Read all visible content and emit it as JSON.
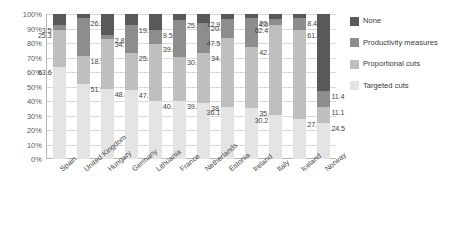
{
  "chart_data": {
    "type": "bar",
    "title": "",
    "xlabel": "",
    "ylabel": "",
    "stacked": true,
    "orientation": "vertical",
    "ylim": [
      0,
      100
    ],
    "ytick_labels": [
      "100%",
      "90%",
      "80%",
      "70%",
      "60%",
      "50%",
      "40%",
      "30%",
      "20%",
      "10%",
      "0%"
    ],
    "ytick_values": [
      100,
      90,
      80,
      70,
      60,
      50,
      40,
      30,
      20,
      10,
      0
    ],
    "grid": true,
    "legend_position": "right",
    "categories": [
      "Spain",
      "United Kingdom",
      "Hungary",
      "Germany",
      "Lithuania",
      "France",
      "Netherlands",
      "Estonia",
      "Ireland",
      "Italy",
      "Iceland",
      "Norway"
    ],
    "series": [
      {
        "name": "Targeted cuts",
        "color": "#e4e4e4",
        "values": [
          63.6,
          51.9,
          48.6,
          47.9,
          40.3,
          39.8,
          38.9,
          36.1,
          35.0,
          30.2,
          27.9,
          24.5
        ],
        "labels": [
          "63.6",
          "51.9",
          "48.6",
          "47.9",
          "40.3",
          "39.8",
          "38.9",
          "36.1",
          "35.0",
          "30.2",
          "27.9",
          "24.5"
        ]
      },
      {
        "name": "Proportional cuts",
        "color": "#bfbfbf",
        "values": [
          25.3,
          18.9,
          34.3,
          25.1,
          39.0,
          30.5,
          34.4,
          47.5,
          42.2,
          62.4,
          61.1,
          11.1
        ],
        "labels": [
          "25.3",
          "18.9",
          "34.3",
          "25.1",
          "39.0",
          "30.5",
          "34.4",
          "47.5",
          "42.2",
          "62.4",
          "61.1",
          "11.1"
        ]
      },
      {
        "name": "Productivity measures",
        "color": "#8d8d8d",
        "values": [
          3.5,
          26.2,
          2.8,
          19.1,
          9.5,
          25.5,
          20.6,
          12.9,
          20.3,
          4.0,
          8.4,
          11.4
        ],
        "labels": [
          "3.5",
          "26.2",
          "2.8",
          "19.1",
          "9.5",
          "25.5",
          "20.6",
          "12.9",
          "20.3",
          "4.0",
          "8.4",
          "11.4"
        ]
      },
      {
        "name": "None",
        "color": "#595959",
        "values": [
          7.6,
          3.0,
          14.3,
          7.9,
          11.2,
          4.2,
          6.1,
          3.5,
          2.5,
          3.4,
          2.6,
          53.0
        ],
        "labels": [
          "",
          "",
          "",
          "",
          "",
          "",
          "",
          "",
          "",
          "",
          "",
          ""
        ]
      }
    ]
  },
  "legend": {
    "items": [
      {
        "label": "None",
        "color": "#595959"
      },
      {
        "label": "Productivity measures",
        "color": "#8d8d8d"
      },
      {
        "label": "Proportional cuts",
        "color": "#bfbfbf"
      },
      {
        "label": "Targeted cuts",
        "color": "#e4e4e4"
      }
    ]
  }
}
